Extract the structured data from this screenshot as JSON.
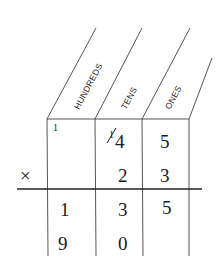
{
  "headers": [
    "HUNDREDS",
    "TENS",
    "ONES"
  ],
  "carries": {
    "hundreds": "1",
    "tens_struck": "1"
  },
  "rows": {
    "multiplicand": {
      "hundreds": "",
      "tens": "4",
      "ones": "5"
    },
    "multiplier": {
      "operator": "×",
      "hundreds": "",
      "tens": "2",
      "ones": "3"
    },
    "partial1": {
      "hundreds": "1",
      "tens": "3",
      "ones": "5"
    },
    "partial2": {
      "hundreds": "9",
      "tens": "0",
      "ones": ""
    }
  }
}
